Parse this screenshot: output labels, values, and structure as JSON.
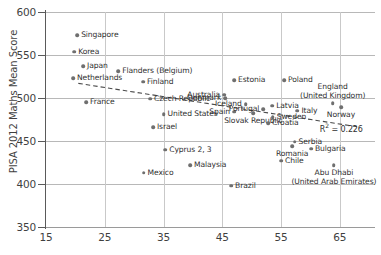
{
  "chart_data": {
    "type": "scatter",
    "title": "",
    "xlabel": "",
    "ylabel": "PISA 2012 Maths Mean Score",
    "xlim": [
      15,
      71
    ],
    "ylim": [
      350,
      600
    ],
    "xticks": [
      15,
      25,
      35,
      45,
      55,
      65
    ],
    "yticks": [
      350,
      400,
      450,
      500,
      550,
      600
    ],
    "grid": true,
    "legend": null,
    "annotations": [
      {
        "name": "r-squared",
        "text": "R",
        "sup": "2",
        "rest": " = 0.226"
      }
    ],
    "trendline": {
      "style": "dashed",
      "x_start": 20.5,
      "y_start": 517,
      "x_end": 68.5,
      "y_end": 466
    },
    "points": [
      {
        "label": "Singapore",
        "x": 20.3,
        "y": 573,
        "label_pos": "right"
      },
      {
        "label": "Korea",
        "x": 19.8,
        "y": 554,
        "label_pos": "right"
      },
      {
        "label": "Japan",
        "x": 21.3,
        "y": 537,
        "label_pos": "right"
      },
      {
        "label": "Netherlands",
        "x": 19.6,
        "y": 523,
        "label_pos": "right"
      },
      {
        "label": "Flanders (Belgium)",
        "x": 27.3,
        "y": 531,
        "label_pos": "right"
      },
      {
        "label": "Finland",
        "x": 31.5,
        "y": 519,
        "label_pos": "right"
      },
      {
        "label": "Estonia",
        "x": 47.0,
        "y": 521,
        "label_pos": "right"
      },
      {
        "label": "Poland",
        "x": 55.5,
        "y": 521,
        "label_pos": "right"
      },
      {
        "label": "England (United Kingdom)",
        "x": 63.8,
        "y": 494,
        "label_pos": "above"
      },
      {
        "label": "France",
        "x": 21.8,
        "y": 495,
        "label_pos": "right"
      },
      {
        "label": "Czech Republic",
        "x": 32.7,
        "y": 499,
        "label_pos": "right"
      },
      {
        "label": "Australia",
        "x": 45.3,
        "y": 504,
        "label_pos": "left"
      },
      {
        "label": "Denmark",
        "x": 45.5,
        "y": 500,
        "label_pos": "left"
      },
      {
        "label": "Iceland",
        "x": 49.0,
        "y": 493,
        "label_pos": "left"
      },
      {
        "label": "Spain",
        "x": 47.0,
        "y": 484,
        "label_pos": "left"
      },
      {
        "label": "Portugal",
        "x": 52.0,
        "y": 487,
        "label_pos": "left"
      },
      {
        "label": "Latvia",
        "x": 53.5,
        "y": 491,
        "label_pos": "right"
      },
      {
        "label": "Sweden",
        "x": 53.6,
        "y": 478,
        "label_pos": "right"
      },
      {
        "label": "Italy",
        "x": 57.8,
        "y": 485,
        "label_pos": "right"
      },
      {
        "label": "Norway",
        "x": 65.2,
        "y": 489,
        "label_pos": "below"
      },
      {
        "label": "Slovak Republic",
        "x": 50.3,
        "y": 482,
        "label_pos": "below"
      },
      {
        "label": "Croatia",
        "x": 52.8,
        "y": 471,
        "label_pos": "right"
      },
      {
        "label": "United States",
        "x": 35.0,
        "y": 481,
        "label_pos": "right"
      },
      {
        "label": "Israel",
        "x": 33.2,
        "y": 466,
        "label_pos": "right"
      },
      {
        "label": "Cyprus 2, 3",
        "x": 35.3,
        "y": 440,
        "label_pos": "right"
      },
      {
        "label": "Malaysia",
        "x": 39.5,
        "y": 422,
        "label_pos": "right"
      },
      {
        "label": "Mexico",
        "x": 31.6,
        "y": 413,
        "label_pos": "right"
      },
      {
        "label": "Serbia",
        "x": 57.3,
        "y": 449,
        "label_pos": "right"
      },
      {
        "label": "Romania",
        "x": 56.9,
        "y": 444,
        "label_pos": "below"
      },
      {
        "label": "Bulgaria",
        "x": 60.1,
        "y": 441,
        "label_pos": "right"
      },
      {
        "label": "Chile",
        "x": 55.0,
        "y": 427,
        "label_pos": "right"
      },
      {
        "label": "Brazil",
        "x": 46.5,
        "y": 398,
        "label_pos": "right"
      },
      {
        "label": "Abu Dhabi (United Arab Emirates)",
        "x": 64.0,
        "y": 422,
        "label_pos": "below"
      }
    ]
  }
}
